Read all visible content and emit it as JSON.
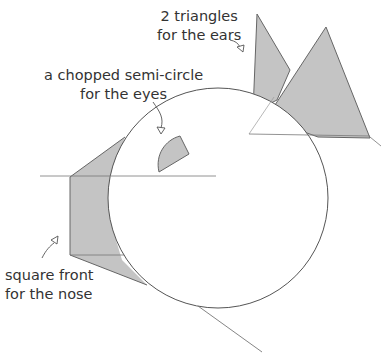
{
  "diagram": {
    "labels": {
      "ears_line1": "2 triangles",
      "ears_line2": "for the ears",
      "eyes_line1": "a chopped semi-circle",
      "eyes_line2": "for the eyes",
      "nose_line1": "square front",
      "nose_line2": "for the nose"
    },
    "colors": {
      "fill": "#c4c4c4",
      "stroke": "#555555"
    }
  }
}
